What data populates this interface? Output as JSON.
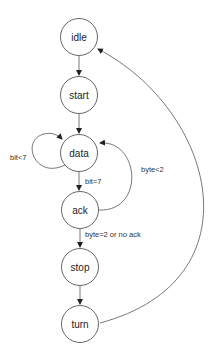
{
  "diagram": {
    "type": "state-machine",
    "nodes": [
      {
        "id": "idle",
        "label": "idle"
      },
      {
        "id": "start",
        "label": "start"
      },
      {
        "id": "data",
        "label": "data"
      },
      {
        "id": "ack",
        "label": "ack"
      },
      {
        "id": "stop",
        "label": "stop"
      },
      {
        "id": "turn",
        "label": "turn"
      }
    ],
    "edges": [
      {
        "from": "idle",
        "to": "start",
        "label": ""
      },
      {
        "from": "start",
        "to": "data",
        "label": ""
      },
      {
        "from": "data",
        "to": "data",
        "label": "bit<7"
      },
      {
        "from": "data",
        "to": "ack",
        "label": "bit=7"
      },
      {
        "from": "ack",
        "to": "data",
        "label": "byte<2"
      },
      {
        "from": "ack",
        "to": "stop",
        "label": "byte=2 or no ack"
      },
      {
        "from": "stop",
        "to": "turn",
        "label": ""
      },
      {
        "from": "turn",
        "to": "idle",
        "label": ""
      }
    ]
  }
}
